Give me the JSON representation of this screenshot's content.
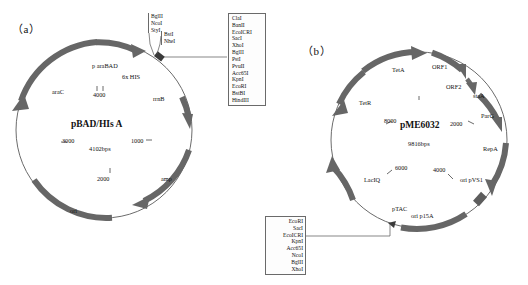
{
  "figure": {
    "panel_a": {
      "label": "（a）",
      "plasmid_name": "pBAD/HIs A",
      "plasmid_size": "4102bps",
      "scale_ticks": [
        {
          "label": "4000"
        },
        {
          "label": "1000"
        },
        {
          "label": "2000"
        },
        {
          "label": "3000"
        }
      ],
      "features": [
        {
          "name": "p araBAD"
        },
        {
          "name": "6x HIS"
        },
        {
          "name": "araC"
        },
        {
          "name": "rrnB"
        },
        {
          "name": "amp"
        },
        {
          "name": "ori"
        }
      ],
      "mcs_upper_group_1": [
        "BglII",
        "NcoI",
        "StyI"
      ],
      "mcs_upper_group_2": [
        "BstI",
        "NheI"
      ],
      "mcs_box": [
        "ClaI",
        "BanII",
        "EcoICRI",
        "SacI",
        "XhoI",
        "BglII",
        "PstI",
        "PvuII",
        "Acc65I",
        "KpnI",
        "EcoRI",
        "BstBI",
        "HindIII"
      ]
    },
    "panel_b": {
      "label": "（b）",
      "plasmid_name": "pME6032",
      "plasmid_size": "9816bps",
      "scale_ticks": [
        {
          "label": "8000"
        },
        {
          "label": "2000"
        },
        {
          "label": "4000"
        },
        {
          "label": "6000"
        }
      ],
      "features": [
        {
          "name": "TetA"
        },
        {
          "name": "TetR"
        },
        {
          "name": "ORF1"
        },
        {
          "name": "ORF2"
        },
        {
          "name": "staA"
        },
        {
          "name": "ParG"
        },
        {
          "name": "RepA"
        },
        {
          "name": "ori pVS1"
        },
        {
          "name": "LacIQ"
        },
        {
          "name": "pTAC"
        },
        {
          "name": "ori p15A"
        }
      ],
      "mcs_box": [
        "EcoRI",
        "SacI",
        "EcoICRI",
        "KpnI",
        "Acc65I",
        "NcoI",
        "BglII",
        "XhoI"
      ]
    }
  },
  "colors": {
    "arc": "#666666",
    "ring": "#5a5a5a",
    "text": "#111111",
    "background": "#ffffff"
  }
}
